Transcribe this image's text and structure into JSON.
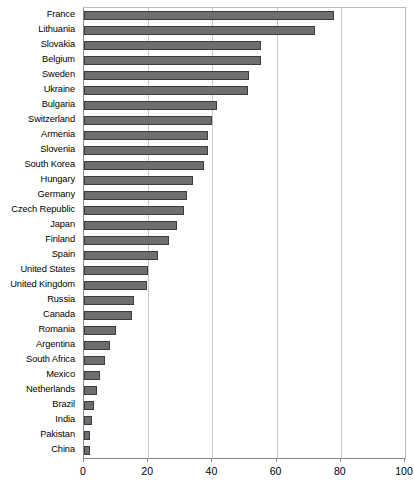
{
  "chart_data": {
    "type": "bar",
    "orientation": "horizontal",
    "title": "",
    "xlabel": "",
    "ylabel": "",
    "xlim": [
      0,
      100
    ],
    "xticks": [
      0,
      20,
      40,
      60,
      80,
      100
    ],
    "grid": "vertical",
    "legend": "none",
    "bar_color": "#6e6e6e",
    "bar_border_color": "#3c3c3c",
    "gridline_color": "#c9c9c9",
    "axis_color": "#8a8a8a",
    "categories": [
      "France",
      "Lithuania",
      "Slovakia",
      "Belgium",
      "Sweden",
      "Ukraine",
      "Bulgaria",
      "Switzerland",
      "Armenia",
      "Slovenia",
      "South Korea",
      "Hungary",
      "Germany",
      "Czech Republic",
      "Japan",
      "Finland",
      "Spain",
      "United States",
      "United Kingdom",
      "Russia",
      "Canada",
      "Romania",
      "Argentina",
      "South Africa",
      "Mexico",
      "Netherlands",
      "Brazil",
      "India",
      "Pakistan",
      "China"
    ],
    "values": [
      78,
      72,
      55,
      55,
      51.5,
      51,
      41.5,
      40,
      38.5,
      38.5,
      37.5,
      34,
      32,
      31,
      29,
      26.5,
      23,
      20,
      19.5,
      15.5,
      15,
      10,
      8,
      6.5,
      5,
      4,
      3,
      2.5,
      2,
      2
    ]
  }
}
